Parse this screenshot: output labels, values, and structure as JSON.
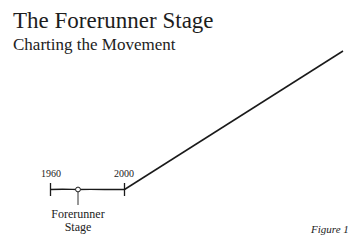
{
  "header": {
    "title": "The Forerunner Stage",
    "subtitle": "Charting the Movement"
  },
  "diagram": {
    "type": "timeline",
    "start_year_label": "1960",
    "end_year_label": "2000",
    "marker_label_line1": "Forerunner",
    "marker_label_line2": "Stage",
    "line_color": "#1a1a1a"
  },
  "caption": {
    "figure_label": "Figure 1"
  }
}
